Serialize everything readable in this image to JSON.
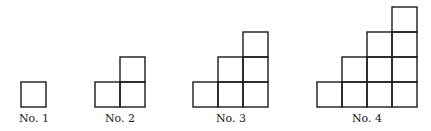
{
  "figures": [
    {
      "label": "No. 1",
      "columns": [
        1
      ],
      "origin_x": 21,
      "center_x": 34
    },
    {
      "label": "No. 2",
      "columns": [
        1,
        2
      ],
      "origin_x": 95,
      "center_x": 120
    },
    {
      "label": "No. 3",
      "columns": [
        1,
        2,
        3
      ],
      "origin_x": 193,
      "center_x": 231
    },
    {
      "label": "No. 4",
      "columns": [
        1,
        2,
        3,
        4
      ],
      "origin_x": 317,
      "center_x": 367
    }
  ],
  "cell_size": 25,
  "baseline_y": 107,
  "label_y": 112,
  "stroke_color": "#1a1a1a"
}
